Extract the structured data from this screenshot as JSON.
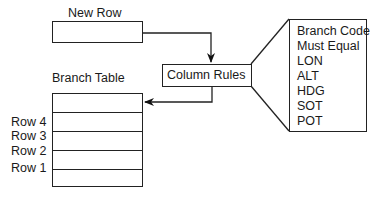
{
  "diagram": {
    "new_row": {
      "label": "New Row"
    },
    "branch_table": {
      "label": "Branch Table",
      "row_labels": [
        "Row 4",
        "Row 3",
        "Row 2",
        "Row 1"
      ]
    },
    "column_rules": {
      "label": "Column Rules"
    },
    "rules_list": {
      "items": [
        "Branch Code",
        "Must Equal",
        "LON",
        "ALT",
        "HDG",
        "SOT",
        "POT"
      ]
    },
    "edges": [
      {
        "from": "new_row",
        "to": "column_rules",
        "type": "arrow"
      },
      {
        "from": "column_rules",
        "to": "branch_table",
        "type": "arrow"
      },
      {
        "from": "column_rules",
        "to": "rules_list",
        "type": "callout"
      }
    ]
  }
}
